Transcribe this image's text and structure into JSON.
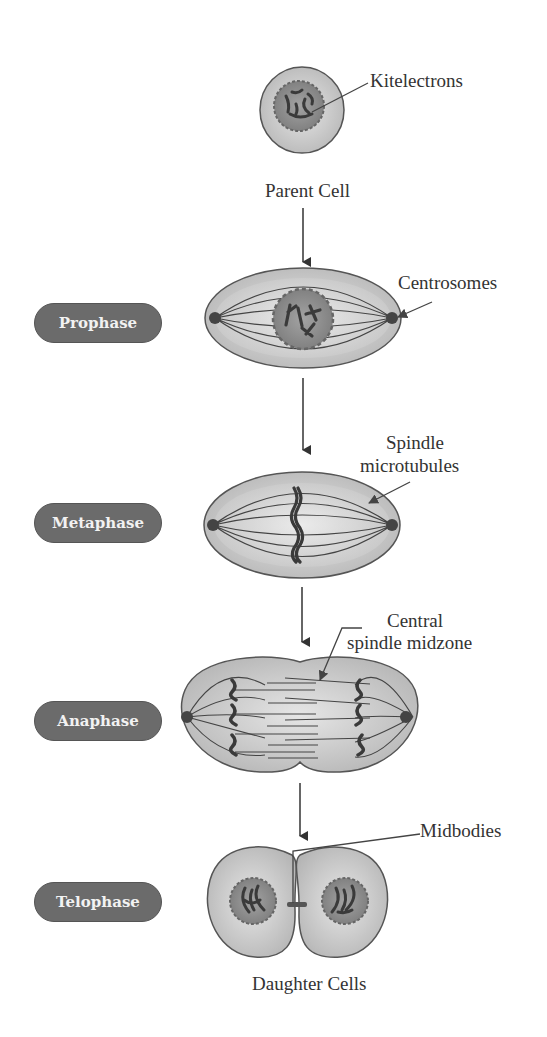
{
  "diagram": {
    "stages": [
      {
        "id": "prophase",
        "label": "Prophase"
      },
      {
        "id": "metaphase",
        "label": "Metaphase"
      },
      {
        "id": "anaphase",
        "label": "Anaphase"
      },
      {
        "id": "telophase",
        "label": "Telophase"
      }
    ],
    "captions": {
      "parent": "Parent Cell",
      "daughters": "Daughter Cells"
    },
    "annotations": {
      "kitelectrons": "Kitelectrons",
      "centrosomes": "Centrosomes",
      "spindle_line1": "Spindle",
      "spindle_line2": "microtubules",
      "midzone_line1": "Central",
      "midzone_line2": "spindle midzone",
      "midbodies": "Midbodies"
    },
    "colors": {
      "cell_fill": "#c4c4c4",
      "cell_stroke": "#555555",
      "nucleus_fill": "#8a8a8a",
      "chromosome": "#3a3a3a",
      "pill_fill": "#6b6b6b",
      "pill_text": "#f2f2f2"
    }
  }
}
